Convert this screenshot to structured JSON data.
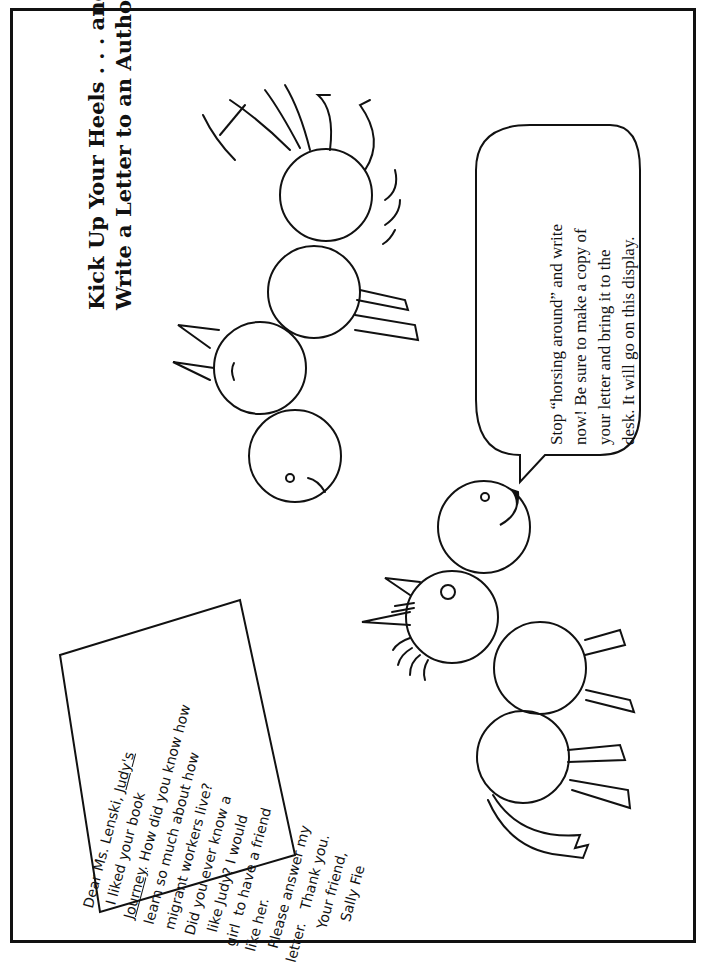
{
  "page": {
    "title_line1": "Kick Up Your Heels . . . and",
    "title_line2": "Write a Letter to an Author!"
  },
  "speech_bubble": {
    "lines": [
      "Stop “horsing around” and write",
      "now! Be sure to make a copy of",
      "your letter and bring it to the",
      "desk. It will go on this display."
    ]
  },
  "letter": {
    "lines": [
      {
        "pre": "Dear Ms. Lenski, ",
        "u": "Judy's",
        "post": ""
      },
      {
        "pre": "  I liked your book",
        "u": "",
        "post": ""
      },
      {
        "pre": "",
        "u": "Journey",
        "post": ". How did you know how"
      },
      {
        "pre": "learn so much about how",
        "u": "",
        "post": ""
      },
      {
        "pre": "migrant workers live?",
        "u": "",
        "post": ""
      },
      {
        "pre": "Did you ever know a",
        "u": "",
        "post": ""
      },
      {
        "pre": "  like Judy? I would",
        "u": "",
        "post": ""
      },
      {
        "pre": "girl  to have a friend",
        "u": "",
        "post": ""
      },
      {
        "pre": "like her.",
        "u": "",
        "post": ""
      },
      {
        "pre": "  Please answer my",
        "u": "",
        "post": ""
      },
      {
        "pre": "letter.   Thank you.",
        "u": "",
        "post": ""
      },
      {
        "pre": "         Your friend,",
        "u": "",
        "post": ""
      },
      {
        "pre": "            Sally Fie",
        "u": "",
        "post": ""
      }
    ]
  },
  "illustrations": [
    {
      "name": "horse-top",
      "description": "four-circle cartoon horse with ears, eye, nose, mane, legs and tail"
    },
    {
      "name": "horse-bottom",
      "description": "four-circle cartoon horse with open mouth speaking, ears, eye, whiskers, legs and tail"
    }
  ],
  "colors": {
    "ink": "#111111",
    "paper": "#ffffff"
  }
}
